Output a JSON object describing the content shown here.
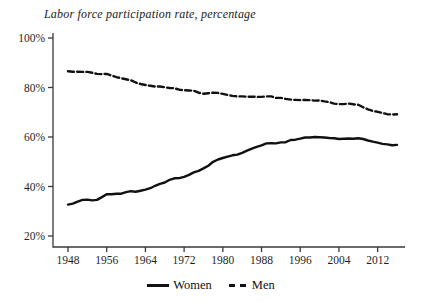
{
  "chart": {
    "title": "Labor force participation rate, percentage"
  },
  "legend": {
    "women": "Women",
    "men": "Men"
  },
  "style": {
    "background": "#ffffff",
    "axis_color": "#3a3a3a",
    "text_color": "#1f1f1f",
    "line_color": "#111111"
  },
  "chart_data": {
    "type": "line",
    "title": "Labor force participation rate, percentage",
    "xlabel": "",
    "ylabel": "",
    "xlim": [
      1948,
      2016
    ],
    "ylim": [
      20,
      100
    ],
    "xticks": [
      1948,
      1956,
      1964,
      1972,
      1980,
      1988,
      1996,
      2004,
      2012
    ],
    "yticks": [
      100,
      80,
      60,
      40,
      20
    ],
    "ytick_suffix": "%",
    "grid": false,
    "legend_position": "bottom-center",
    "x": [
      1948,
      1949,
      1950,
      1951,
      1952,
      1953,
      1954,
      1955,
      1956,
      1957,
      1958,
      1959,
      1960,
      1961,
      1962,
      1963,
      1964,
      1965,
      1966,
      1967,
      1968,
      1969,
      1970,
      1971,
      1972,
      1973,
      1974,
      1975,
      1976,
      1977,
      1978,
      1979,
      1980,
      1981,
      1982,
      1983,
      1984,
      1985,
      1986,
      1987,
      1988,
      1989,
      1990,
      1991,
      1992,
      1993,
      1994,
      1995,
      1996,
      1997,
      1998,
      1999,
      2000,
      2001,
      2002,
      2003,
      2004,
      2005,
      2006,
      2007,
      2008,
      2009,
      2010,
      2011,
      2012,
      2013,
      2014,
      2015,
      2016
    ],
    "series": [
      {
        "name": "Women",
        "style": "solid",
        "color": "#111111",
        "values": [
          32.7,
          33.1,
          33.9,
          34.6,
          34.7,
          34.4,
          34.6,
          35.7,
          36.9,
          36.9,
          37.1,
          37.1,
          37.7,
          38.1,
          37.9,
          38.3,
          38.7,
          39.3,
          40.3,
          41.1,
          41.6,
          42.7,
          43.3,
          43.4,
          43.9,
          44.7,
          45.7,
          46.3,
          47.3,
          48.4,
          50.0,
          50.9,
          51.5,
          52.1,
          52.6,
          52.9,
          53.6,
          54.5,
          55.3,
          56.0,
          56.6,
          57.4,
          57.5,
          57.4,
          57.8,
          57.9,
          58.8,
          58.9,
          59.3,
          59.8,
          59.8,
          60.0,
          59.9,
          59.8,
          59.6,
          59.5,
          59.2,
          59.3,
          59.4,
          59.3,
          59.5,
          59.2,
          58.6,
          58.1,
          57.7,
          57.2,
          57.0,
          56.7,
          56.8
        ]
      },
      {
        "name": "Men",
        "style": "dashed",
        "color": "#111111",
        "values": [
          86.6,
          86.4,
          86.4,
          86.3,
          86.3,
          86.0,
          85.5,
          85.4,
          85.5,
          84.8,
          84.2,
          83.7,
          83.3,
          82.9,
          82.0,
          81.4,
          81.0,
          80.7,
          80.4,
          80.4,
          80.1,
          79.8,
          79.7,
          79.1,
          78.9,
          78.8,
          78.7,
          77.9,
          77.5,
          77.7,
          77.9,
          77.8,
          77.4,
          77.0,
          76.6,
          76.4,
          76.4,
          76.3,
          76.3,
          76.2,
          76.2,
          76.4,
          76.4,
          75.8,
          75.8,
          75.4,
          75.1,
          75.0,
          74.9,
          75.0,
          74.9,
          74.7,
          74.8,
          74.4,
          74.1,
          73.5,
          73.3,
          73.3,
          73.5,
          73.2,
          73.0,
          72.0,
          71.2,
          70.5,
          70.2,
          69.7,
          69.2,
          69.1,
          69.2
        ]
      }
    ]
  }
}
